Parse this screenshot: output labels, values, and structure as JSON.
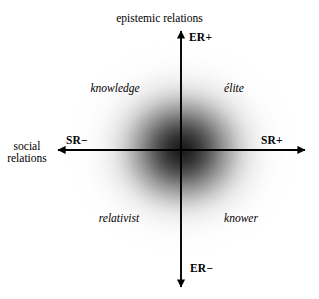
{
  "figure": {
    "type": "quadrant-plane",
    "origin": {
      "x": 181,
      "y": 150
    },
    "axes": {
      "vertical": {
        "title": "epistemic relations",
        "positive_pole": "ER+",
        "negative_pole": "ER−"
      },
      "horizontal": {
        "title_line1": "social",
        "title_line2": "relations",
        "positive_pole": "SR+",
        "negative_pole": "SR−"
      }
    },
    "quadrants": [
      {
        "name": "knowledge-code",
        "label": "knowledge",
        "position": "upper-left"
      },
      {
        "name": "elite-code",
        "label": "élite",
        "position": "upper-right"
      },
      {
        "name": "relativist-code",
        "label": "relativist",
        "position": "lower-left"
      },
      {
        "name": "knower-code",
        "label": "knower",
        "position": "lower-right"
      }
    ],
    "colors": {
      "axis": "#000000",
      "text": "#000000",
      "background": "#ffffff",
      "cloud_core": "#161616"
    }
  }
}
